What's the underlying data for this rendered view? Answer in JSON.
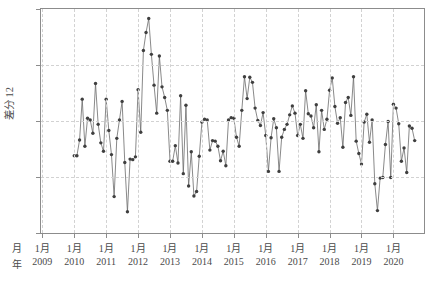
{
  "chart_data": {
    "type": "line",
    "title": "",
    "xlabel": "",
    "ylabel": "差分 12",
    "ylim": [
      -20,
      20
    ],
    "yticks": [
      -20,
      -10,
      0,
      10,
      20
    ],
    "ytick_labels": [
      "-20",
      "-10",
      "0",
      "10",
      "20"
    ],
    "xlim": [
      "2009-01",
      "2020-12"
    ],
    "grid": true,
    "grid_style": "dashed",
    "legend": "none",
    "marker": "filled-circle",
    "line_color": "#6b6b6b",
    "marker_color": "#3f3f3f",
    "x_axis_rows": {
      "month_row_header": "月",
      "year_row_header": "年",
      "month_label": "1月",
      "years": [
        "2009",
        "2010",
        "2011",
        "2012",
        "2013",
        "2014",
        "2015",
        "2016",
        "2017",
        "2018",
        "2019",
        "2020"
      ]
    },
    "x": [
      "2010-01",
      "2010-02",
      "2010-03",
      "2010-04",
      "2010-05",
      "2010-06",
      "2010-07",
      "2010-08",
      "2010-09",
      "2010-10",
      "2010-11",
      "2010-12",
      "2011-01",
      "2011-02",
      "2011-03",
      "2011-04",
      "2011-05",
      "2011-06",
      "2011-07",
      "2011-08",
      "2011-09",
      "2011-10",
      "2011-11",
      "2011-12",
      "2012-01",
      "2012-02",
      "2012-03",
      "2012-04",
      "2012-05",
      "2012-06",
      "2012-07",
      "2012-08",
      "2012-09",
      "2012-10",
      "2012-11",
      "2012-12",
      "2013-01",
      "2013-02",
      "2013-03",
      "2013-04",
      "2013-05",
      "2013-06",
      "2013-07",
      "2013-08",
      "2013-09",
      "2013-10",
      "2013-11",
      "2013-12",
      "2014-01",
      "2014-02",
      "2014-03",
      "2014-04",
      "2014-05",
      "2014-06",
      "2014-07",
      "2014-08",
      "2014-09",
      "2014-10",
      "2014-11",
      "2014-12",
      "2015-01",
      "2015-02",
      "2015-03",
      "2015-04",
      "2015-05",
      "2015-06",
      "2015-07",
      "2015-08",
      "2015-09",
      "2015-10",
      "2015-11",
      "2015-12",
      "2016-01",
      "2016-02",
      "2016-03",
      "2016-04",
      "2016-05",
      "2016-06",
      "2016-07",
      "2016-08",
      "2016-09",
      "2016-10",
      "2016-11",
      "2016-12",
      "2017-01",
      "2017-02",
      "2017-03",
      "2017-04",
      "2017-05",
      "2017-06",
      "2017-07",
      "2017-08",
      "2017-09",
      "2017-10",
      "2017-11",
      "2017-12",
      "2018-01",
      "2018-02",
      "2018-03",
      "2018-04",
      "2018-05",
      "2018-06",
      "2018-07",
      "2018-08",
      "2018-09",
      "2018-10",
      "2018-11",
      "2018-12",
      "2019-01",
      "2019-02",
      "2019-03",
      "2019-04",
      "2019-05",
      "2019-06",
      "2019-07",
      "2019-08",
      "2019-09",
      "2019-10",
      "2019-11",
      "2019-12",
      "2020-01",
      "2020-02",
      "2020-03",
      "2020-04",
      "2020-05",
      "2020-06",
      "2020-07",
      "2020-08",
      "2020-09"
    ],
    "values": [
      -6.2,
      -6.2,
      -3.4,
      3.9,
      -4.5,
      0.5,
      0.2,
      -2.2,
      6.7,
      -0.6,
      -3.9,
      -5.4,
      3.9,
      -1.7,
      -6.0,
      -13.5,
      -3.1,
      0.2,
      3.5,
      -7.4,
      -16.2,
      -6.8,
      -6.9,
      -6.4,
      5.6,
      -2.0,
      12.6,
      15.8,
      18.3,
      11.9,
      6.4,
      1.4,
      11.6,
      6.1,
      4.2,
      1.9,
      -7.2,
      -7.2,
      -4.4,
      -7.5,
      4.5,
      -9.4,
      2.8,
      -11.6,
      -5.5,
      -13.4,
      -12.6,
      -6.3,
      -0.2,
      0.3,
      0.2,
      -5.2,
      -3.5,
      -3.6,
      -4.5,
      -7.1,
      -5.4,
      -8.0,
      0.2,
      0.6,
      0.5,
      -2.9,
      -4.5,
      1.9,
      7.9,
      4.0,
      7.8,
      6.9,
      2.3,
      0.1,
      -0.8,
      1.5,
      -2.6,
      -9.0,
      -3.0,
      0.4,
      -1.2,
      -9.0,
      -2.9,
      -1.5,
      -0.6,
      1.1,
      2.7,
      1.4,
      -2.6,
      -0.6,
      -3.1,
      5.4,
      1.3,
      0.9,
      -1.2,
      2.9,
      -5.5,
      1.9,
      -1.5,
      0.3,
      5.5,
      7.7,
      2.6,
      -0.4,
      0.6,
      -4.7,
      3.3,
      4.2,
      1.0,
      7.9,
      -3.6,
      -5.8,
      -7.7,
      -0.2,
      1.2,
      -3.8,
      0.2,
      -11.2,
      -16.0,
      -10.2,
      -10.1,
      -4.2,
      -0.1,
      -10.1,
      3.0,
      2.3,
      -0.5,
      -7.2,
      -4.8,
      -9.2,
      -0.9,
      -1.3,
      -3.5
    ]
  },
  "caption": {
    "text": ""
  }
}
